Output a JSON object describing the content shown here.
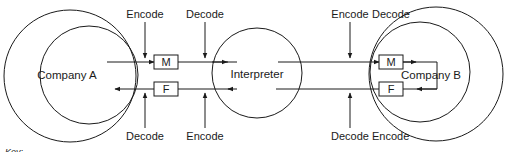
{
  "diagram": {
    "entities": {
      "company_a": "Company A",
      "interpreter": "Interpreter",
      "company_b": "Company B"
    },
    "boxes": {
      "left_m": "M",
      "left_f": "F",
      "right_m": "M",
      "right_f": "F"
    },
    "labels": {
      "top": [
        "Encode",
        "Decode",
        "Encode",
        "Decode"
      ],
      "bottom": [
        "Decode",
        "Encode",
        "Decode",
        "Encode"
      ]
    },
    "key_label": "Key:",
    "colors": {
      "stroke": "#1a1a1a",
      "background": "#ffffff"
    }
  }
}
